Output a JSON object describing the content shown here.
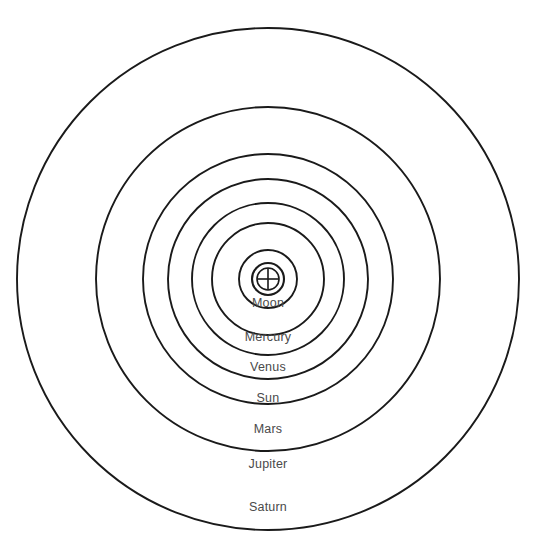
{
  "diagram": {
    "center_symbol": "earth-symbol",
    "background_color": "#ffffff",
    "stroke_color": "#1a1a1a",
    "label_color": "#4a4a4a"
  },
  "chart_data": {
    "type": "scatter",
    "title": "",
    "xlabel": "",
    "ylabel": "",
    "grid": false,
    "legend": "none",
    "center": {
      "x": 268,
      "y": 279,
      "label": "Earth"
    },
    "categories": [
      "Moon",
      "Mercury",
      "Venus",
      "Sun",
      "Mars",
      "Jupiter",
      "Saturn"
    ],
    "values": [
      29,
      56,
      76,
      100,
      125,
      172,
      251
    ],
    "series": [
      {
        "name": "Orbit radius (px)",
        "values": [
          29,
          56,
          76,
          100,
          125,
          172,
          251
        ]
      }
    ],
    "annotations": [
      {
        "text": "Moon",
        "x": 268,
        "y": 303
      },
      {
        "text": "Mercury",
        "x": 268,
        "y": 337
      },
      {
        "text": "Venus",
        "x": 268,
        "y": 367
      },
      {
        "text": "Sun",
        "x": 268,
        "y": 398
      },
      {
        "text": "Mars",
        "x": 268,
        "y": 429
      },
      {
        "text": "Jupiter",
        "x": 268,
        "y": 464
      },
      {
        "text": "Saturn",
        "x": 268,
        "y": 507
      }
    ]
  },
  "center_body": {
    "name": "Earth",
    "symbol_name": "earth-symbol",
    "outer_radius": 16,
    "inner_radius": 11
  },
  "orbits": [
    {
      "label": "Moon",
      "radius": 29,
      "label_x": 268,
      "label_y": 303
    },
    {
      "label": "Mercury",
      "radius": 56,
      "label_x": 268,
      "label_y": 337
    },
    {
      "label": "Venus",
      "radius": 76,
      "label_x": 268,
      "label_y": 367
    },
    {
      "label": "Sun",
      "radius": 100,
      "label_x": 268,
      "label_y": 398
    },
    {
      "label": "Mars",
      "radius": 125,
      "label_x": 268,
      "label_y": 429
    },
    {
      "label": "Jupiter",
      "radius": 172,
      "label_x": 268,
      "label_y": 464
    },
    {
      "label": "Saturn",
      "radius": 251,
      "label_x": 268,
      "label_y": 507
    }
  ]
}
